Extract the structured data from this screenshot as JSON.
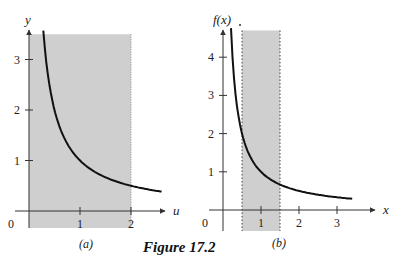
{
  "caption": "Figure 17.2",
  "colors": {
    "shade": "#cfcfcf",
    "curve": "#111111",
    "axis": "#333333"
  },
  "chart_data": [
    {
      "type": "area",
      "panel": "(a)",
      "function": "y = 1/x",
      "xlabel": "u",
      "ylabel": "y",
      "x_ticks": [
        1,
        2
      ],
      "y_ticks": [
        1,
        2,
        3
      ],
      "origin_label": "0",
      "xlim": [
        0,
        2.7
      ],
      "ylim": [
        0,
        3.6
      ],
      "shaded_region": {
        "x": [
          0,
          2
        ],
        "y": [
          0,
          3.5
        ]
      },
      "curve_points": [
        [
          0.28,
          3.5
        ],
        [
          0.5,
          2.0
        ],
        [
          1.0,
          1.0
        ],
        [
          1.5,
          0.667
        ],
        [
          2.0,
          0.5
        ],
        [
          2.6,
          0.385
        ]
      ]
    },
    {
      "type": "area",
      "panel": "(b)",
      "function": "f(x) = 1/x",
      "xlabel": "x",
      "ylabel": "f(x)",
      "x_ticks": [
        1,
        2,
        3
      ],
      "y_ticks": [
        1,
        2,
        3,
        4
      ],
      "origin_label": "0",
      "xlim": [
        0,
        3.6
      ],
      "ylim": [
        0,
        4.8
      ],
      "shaded_region": {
        "x": [
          0.5,
          1.5
        ],
        "y": [
          0,
          4.7
        ]
      },
      "curve_points": [
        [
          0.21,
          4.7
        ],
        [
          0.5,
          2.0
        ],
        [
          1.0,
          1.0
        ],
        [
          1.5,
          0.667
        ],
        [
          2.0,
          0.5
        ],
        [
          3.0,
          0.333
        ],
        [
          3.4,
          0.3
        ]
      ]
    }
  ]
}
